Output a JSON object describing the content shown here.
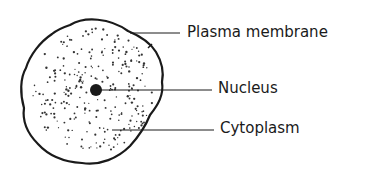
{
  "diagram": {
    "labels": [
      {
        "id": "plasma-membrane",
        "text": "Plasma membrane",
        "x": 187,
        "y": 25,
        "line": [
          130,
          33,
          180,
          33
        ]
      },
      {
        "id": "nucleus",
        "text": "Nucleus",
        "x": 218,
        "y": 81,
        "line": [
          96,
          90,
          212,
          90
        ]
      },
      {
        "id": "cytoplasm",
        "text": "Cytoplasm",
        "x": 220,
        "y": 121,
        "line": [
          112,
          130,
          214,
          130
        ]
      }
    ],
    "colors": {
      "stroke": "#1a1a1a",
      "background": "#ffffff"
    }
  }
}
